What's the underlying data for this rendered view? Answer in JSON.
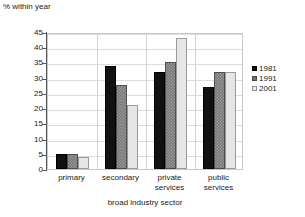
{
  "chart_data": {
    "type": "bar",
    "title": "",
    "ylabel": "% within year",
    "xlabel": "broad industry sector",
    "categories": [
      "primary",
      "secondary",
      "private services",
      "public services"
    ],
    "series": [
      {
        "name": "1981",
        "color": "#111111",
        "values": [
          5,
          34,
          32,
          27
        ]
      },
      {
        "name": "1991",
        "color": "#7a7a7a",
        "values": [
          5,
          27.5,
          35,
          32
        ]
      },
      {
        "name": "2001",
        "color": "#e6e6e6",
        "values": [
          4,
          21,
          43,
          32
        ]
      }
    ],
    "ylim": [
      0,
      45
    ],
    "ytick_values": [
      0,
      5,
      10,
      15,
      20,
      25,
      30,
      35,
      40,
      45
    ],
    "ytick_labels": [
      "0",
      "5",
      "10",
      "15",
      "20",
      "25",
      "30",
      "35",
      "40",
      "45"
    ],
    "grid": true,
    "legend_position": "right"
  },
  "axis": {
    "y_title": "% within year",
    "x_title": "broad industry sector"
  },
  "x_labels": [
    {
      "line1": "primary",
      "line2": ""
    },
    {
      "line1": "secondary",
      "line2": ""
    },
    {
      "line1": "private",
      "line2": "services"
    },
    {
      "line1": "public",
      "line2": "services"
    }
  ],
  "legend": {
    "items": [
      {
        "label": "1981",
        "swatch": "y1981"
      },
      {
        "label": "1991",
        "swatch": "y1991"
      },
      {
        "label": "2001",
        "swatch": "y2001"
      }
    ]
  }
}
